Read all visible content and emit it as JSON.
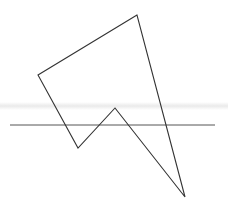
{
  "diagram": {
    "width": 228,
    "height": 201,
    "stroke_color": "#333333",
    "line_color": "#555555",
    "polygon": {
      "points": [
        [
          137,
          15
        ],
        [
          38,
          75
        ],
        [
          78,
          148
        ],
        [
          115,
          108
        ],
        [
          185,
          197
        ]
      ],
      "closed": true
    },
    "horizontal_line": {
      "x1": 10,
      "y1": 125,
      "x2": 215,
      "y2": 125
    }
  }
}
